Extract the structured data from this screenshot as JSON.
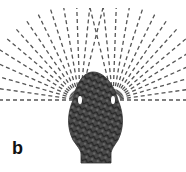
{
  "figure": {
    "panel_label": "b",
    "colors": {
      "rays": "#555555",
      "body": "#4a4a4a",
      "body_texture": "#2a2a2a",
      "eye": "#ffffff",
      "background": "#ffffff"
    },
    "eyes": [
      {
        "name": "left",
        "x": 80,
        "y": 100
      },
      {
        "name": "right",
        "x": 113,
        "y": 100
      }
    ],
    "left_ray_angles_deg": [
      180,
      172,
      164,
      156,
      148,
      140,
      132,
      124,
      116,
      108,
      100,
      92,
      84,
      76
    ],
    "right_ray_angles_deg": [
      0,
      8,
      16,
      24,
      32,
      40,
      48,
      56,
      64,
      72,
      80,
      88,
      96,
      104
    ],
    "ray_length": 95
  }
}
